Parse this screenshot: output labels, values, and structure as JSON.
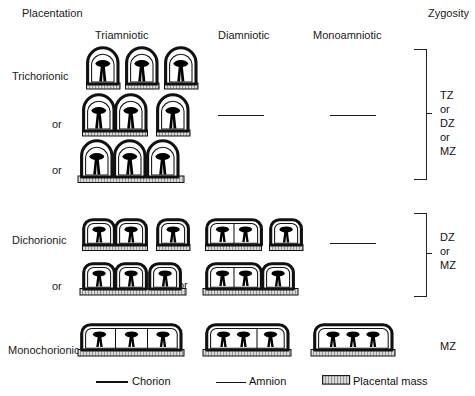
{
  "header": {
    "placentation": "Placentation",
    "zygosity": "Zygosity"
  },
  "columns": [
    {
      "key": "triamniotic",
      "label": "Triamniotic"
    },
    {
      "key": "diamniotic",
      "label": "Diamniotic"
    },
    {
      "key": "monoamniotic",
      "label": "Monoamniotic"
    }
  ],
  "rows": [
    {
      "key": "trichorionic",
      "label": "Trichorionic",
      "or_labels": [
        "or",
        "or"
      ],
      "zygosity": "TZ\nor\nDZ\nor\nMZ",
      "zygosity_lines": [
        "TZ",
        "or",
        "DZ",
        "or",
        "MZ"
      ],
      "variants": [
        {
          "description": "three separate sacs, each with its own placental mass"
        },
        {
          "description": "two fused sacs sharing one placental mass, one separate sac"
        },
        {
          "description": "three sacs on one continuous placental mass"
        }
      ],
      "diamniotic": "—",
      "monoamniotic": "—"
    },
    {
      "key": "dichorionic",
      "label": "Dichorionic",
      "or_labels": [
        "or",
        "or"
      ],
      "zygosity": "DZ\nor\nMZ",
      "zygosity_lines": [
        "DZ",
        "or",
        "MZ"
      ],
      "variants": [
        {
          "description": "two fused chorionic sacs plus one separate sac, separate placental masses"
        },
        {
          "description": "two fused chorionic sacs plus one separate sac on one placental mass"
        }
      ],
      "monoamniotic": "—"
    },
    {
      "key": "monochorionic",
      "label": "Monochorionic",
      "zygosity": "MZ",
      "zygosity_lines": [
        "MZ"
      ],
      "variants": [
        {
          "description": "single chorion, three amniotic compartments"
        },
        {
          "description": "single chorion, two amniotic compartments"
        },
        {
          "description": "single chorion, no amniotic divisions"
        }
      ]
    }
  ],
  "legend": [
    {
      "key": "chorion",
      "label": "Chorion",
      "symbol": "thick-line"
    },
    {
      "key": "amnion",
      "label": "Amnion",
      "symbol": "thin-line"
    },
    {
      "key": "placental-mass",
      "label": "Placental mass",
      "symbol": "hatched-bar"
    }
  ],
  "colors": {
    "ink": "#111111",
    "background": "#ffffff",
    "placental_fill": "#d9d9d9"
  }
}
